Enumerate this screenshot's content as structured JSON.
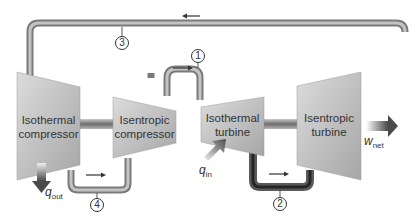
{
  "diagram": {
    "components": [
      {
        "id": "isothermal-compressor",
        "label_line1": "Isothermal",
        "label_line2": "compressor"
      },
      {
        "id": "isentropic-compressor",
        "label_line1": "Isentropic",
        "label_line2": "compressor"
      },
      {
        "id": "isothermal-turbine",
        "label_line1": "Isothermal",
        "label_line2": "turbine"
      },
      {
        "id": "isentropic-turbine",
        "label_line1": "Isentropic",
        "label_line2": "turbine"
      }
    ],
    "states": [
      "1",
      "2",
      "3",
      "4"
    ],
    "heat_in": {
      "symbol": "q",
      "subscript": "in"
    },
    "heat_out": {
      "symbol": "q",
      "subscript": "out"
    },
    "work_net": {
      "symbol": "w",
      "subscript": "net"
    },
    "colors": {
      "machine_fill_light": "#d4d4d4",
      "machine_fill_dark": "#a9a9a9",
      "pipe": "#8c8c8c",
      "pipe_highlight": "#c8c8c8",
      "arrow": "#333333",
      "heat_arrow": "#555555"
    }
  }
}
